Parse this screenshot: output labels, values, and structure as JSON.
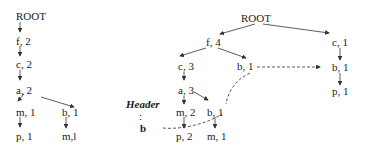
{
  "left_tree": {
    "root": "ROOT",
    "nodes": {
      "f": "f, 2",
      "c": "c, 2",
      "a": "a, 2",
      "m": "m, 1",
      "b": "b, 1",
      "p": "p, 1",
      "mb": "m,l"
    }
  },
  "right_tree": {
    "root": "ROOT",
    "nodes": {
      "f": "f, 4",
      "c3": "c, 3",
      "b_f": "b, 1",
      "a": "a, 3",
      "m2": "m, 2",
      "b_a": "b, 1",
      "p2": "p, 2",
      "m1": "m, 1",
      "c1": "c, 1",
      "b_c": "b, 1",
      "p1": "p, 1"
    }
  },
  "header_table": {
    "title": "Header",
    "ellipsis": ":",
    "entry": "b"
  },
  "colors": {
    "line": "#333333",
    "text": "#1a1a1a"
  }
}
